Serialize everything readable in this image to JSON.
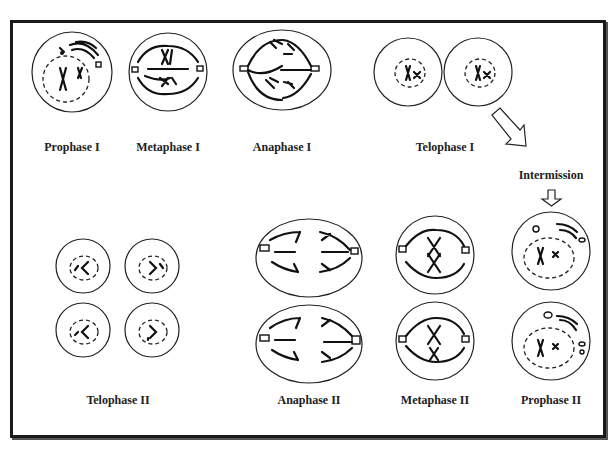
{
  "diagram": {
    "frame": {
      "border_color": "#1a1a1a",
      "background": "#ffffff"
    },
    "stages": [
      {
        "id": "prophase-1",
        "label": "Prophase I",
        "row": 1
      },
      {
        "id": "metaphase-1",
        "label": "Metaphase I",
        "row": 1
      },
      {
        "id": "anaphase-1",
        "label": "Anaphase I",
        "row": 1
      },
      {
        "id": "telophase-1",
        "label": "Telophase I",
        "row": 1
      },
      {
        "id": "intermission",
        "label": "Intermission",
        "row": 1
      },
      {
        "id": "prophase-2",
        "label": "Prophase II",
        "row": 2
      },
      {
        "id": "metaphase-2",
        "label": "Metaphase II",
        "row": 2
      },
      {
        "id": "anaphase-2",
        "label": "Anaphase II",
        "row": 2
      },
      {
        "id": "telophase-2",
        "label": "Telophase II",
        "row": 2
      }
    ],
    "flow": [
      "Prophase I",
      "Metaphase I",
      "Anaphase I",
      "Telophase I",
      "Intermission",
      "Prophase II",
      "Metaphase II",
      "Anaphase II",
      "Telophase II"
    ]
  }
}
